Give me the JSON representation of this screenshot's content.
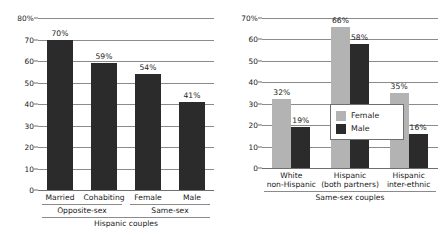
{
  "chart_data": [
    {
      "type": "bar",
      "id": "left",
      "title": "",
      "xlabel": "Hispanic couples",
      "ylabel": "",
      "ylim": [
        0,
        80
      ],
      "grid": true,
      "legend": "none",
      "axis_tick_labels": [
        "80%",
        "70",
        "60",
        "50",
        "40",
        "30",
        "20",
        "10",
        "0"
      ],
      "axis_ticks": [
        80,
        70,
        60,
        50,
        40,
        30,
        20,
        10,
        0
      ],
      "categories": [
        "Married",
        "Cohabiting",
        "Female",
        "Male"
      ],
      "values": [
        70,
        59,
        54,
        41
      ],
      "value_labels": [
        "70%",
        "59%",
        "54%",
        "41%"
      ],
      "bar_color": "#2b2b2b",
      "groups": [
        {
          "label": "Opposite-sex",
          "categories": [
            "Married",
            "Cohabiting"
          ]
        },
        {
          "label": "Same-sex",
          "categories": [
            "Female",
            "Male"
          ]
        }
      ],
      "overall_group_label": "Hispanic couples"
    },
    {
      "type": "bar",
      "id": "right",
      "title": "",
      "xlabel": "Same-sex couples",
      "ylabel": "",
      "ylim": [
        0,
        70
      ],
      "grid": true,
      "legend": "inside-center",
      "axis_tick_labels": [
        "70%",
        "60",
        "50",
        "40",
        "30",
        "20",
        "10",
        "0"
      ],
      "axis_ticks": [
        70,
        60,
        50,
        40,
        30,
        20,
        10,
        0
      ],
      "categories": [
        {
          "line1": "White",
          "line2": "non-Hispanic"
        },
        {
          "line1": "Hispanic",
          "line2": "(both partners)"
        },
        {
          "line1": "Hispanic",
          "line2": "inter-ethnic"
        }
      ],
      "series": [
        {
          "name": "Female",
          "color": "#b3b3b3",
          "values": [
            32,
            66,
            35
          ],
          "value_labels": [
            "32%",
            "66%",
            "35%"
          ]
        },
        {
          "name": "Male",
          "color": "#2b2b2b",
          "values": [
            19,
            58,
            16
          ],
          "value_labels": [
            "19%",
            "58%",
            "16%"
          ]
        }
      ],
      "overall_group_label": "Same-sex couples"
    }
  ],
  "left_chart": {
    "yticks": [
      {
        "label": "80%",
        "value": 80
      },
      {
        "label": "70",
        "value": 70
      },
      {
        "label": "60",
        "value": 60
      },
      {
        "label": "50",
        "value": 50
      },
      {
        "label": "40",
        "value": 40
      },
      {
        "label": "30",
        "value": 30
      },
      {
        "label": "20",
        "value": 20
      },
      {
        "label": "10",
        "value": 10
      },
      {
        "label": "0",
        "value": 0
      }
    ],
    "bars": [
      {
        "category": "Married",
        "value": 70,
        "value_label": "70%"
      },
      {
        "category": "Cohabiting",
        "value": 59,
        "value_label": "59%"
      },
      {
        "category": "Female",
        "value": 54,
        "value_label": "54%"
      },
      {
        "category": "Male",
        "value": 41,
        "value_label": "41%"
      }
    ],
    "groups": [
      {
        "label": "Opposite-sex"
      },
      {
        "label": "Same-sex"
      }
    ],
    "footer_label": "Hispanic couples"
  },
  "right_chart": {
    "yticks": [
      {
        "label": "70%",
        "value": 70
      },
      {
        "label": "60",
        "value": 60
      },
      {
        "label": "50",
        "value": 50
      },
      {
        "label": "40",
        "value": 40
      },
      {
        "label": "30",
        "value": 30
      },
      {
        "label": "20",
        "value": 20
      },
      {
        "label": "10",
        "value": 10
      },
      {
        "label": "0",
        "value": 0
      }
    ],
    "groups": [
      {
        "line1": "White",
        "line2": "non-Hispanic",
        "female": {
          "value": 32,
          "value_label": "32%"
        },
        "male": {
          "value": 19,
          "value_label": "19%"
        }
      },
      {
        "line1": "Hispanic",
        "line2": "(both partners)",
        "female": {
          "value": 66,
          "value_label": "66%"
        },
        "male": {
          "value": 58,
          "value_label": "58%"
        }
      },
      {
        "line1": "Hispanic",
        "line2": "inter-ethnic",
        "female": {
          "value": 35,
          "value_label": "35%"
        },
        "male": {
          "value": 16,
          "value_label": "16%"
        }
      }
    ],
    "legend": {
      "female_label": "Female",
      "male_label": "Male"
    },
    "footer_label": "Same-sex couples"
  },
  "colors": {
    "female_bar": "#b3b3b3",
    "male_bar": "#2b2b2b",
    "gridline": "#8b8b8b",
    "text": "#1a1a1a",
    "background": "#ffffff"
  }
}
